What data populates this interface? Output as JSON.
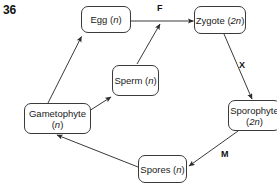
{
  "page": {
    "question_number": "36",
    "background_color": "#ffffff",
    "line_color": "#3a3a3a",
    "text_color": "#1a1a1a"
  },
  "diagram": {
    "nodes": [
      {
        "id": "egg",
        "label": "Egg (n)",
        "name_text": "Egg",
        "ploidy": "n",
        "x": 81,
        "y": 6,
        "w": 50,
        "h": 27
      },
      {
        "id": "zygote",
        "label": "Zygote (2n)",
        "name_text": "Zygote",
        "ploidy": "2n",
        "x": 194,
        "y": 6,
        "w": 52,
        "h": 28
      },
      {
        "id": "sperm",
        "label": "Sperm (n)",
        "name_text": "Sperm",
        "ploidy": "n",
        "x": 112,
        "y": 65,
        "w": 47,
        "h": 31
      },
      {
        "id": "gametophyte",
        "label": "Gametophyte (n)",
        "name_text": "Gametophyte",
        "ploidy": "n",
        "x": 24,
        "y": 103,
        "w": 67,
        "h": 31
      },
      {
        "id": "sporophyte",
        "label": "Sporophyte (2n)",
        "name_text": "Sporophyte",
        "ploidy": "2n",
        "x": 228,
        "y": 100,
        "w": 53,
        "h": 31
      },
      {
        "id": "spores",
        "label": "Spores (n)",
        "name_text": "Spores",
        "ploidy": "n",
        "x": 138,
        "y": 155,
        "w": 49,
        "h": 28
      }
    ],
    "edges": [
      {
        "id": "gametophyte-to-egg",
        "from": "gametophyte",
        "to": "egg",
        "label": ""
      },
      {
        "id": "gametophyte-to-sperm",
        "from": "gametophyte",
        "to": "sperm",
        "label": ""
      },
      {
        "id": "egg-to-zygote",
        "from": "egg",
        "to": "zygote",
        "label": "F"
      },
      {
        "id": "sperm-to-zygote",
        "from": "sperm",
        "to": "zygote",
        "label": "F"
      },
      {
        "id": "zygote-to-sporophyte",
        "from": "zygote",
        "to": "sporophyte",
        "label": "X"
      },
      {
        "id": "sporophyte-to-spores",
        "from": "sporophyte",
        "to": "spores",
        "label": "M"
      },
      {
        "id": "spores-to-gametophyte",
        "from": "spores",
        "to": "gametophyte",
        "label": ""
      }
    ],
    "edge_labels": [
      {
        "id": "F",
        "text": "F",
        "x": 157,
        "y": 3,
        "meaning": "fertilization"
      },
      {
        "id": "X",
        "text": "X",
        "x": 239,
        "y": 60,
        "meaning": "unlabeled process"
      },
      {
        "id": "M",
        "text": "M",
        "x": 221,
        "y": 149,
        "meaning": "meiosis"
      }
    ]
  }
}
